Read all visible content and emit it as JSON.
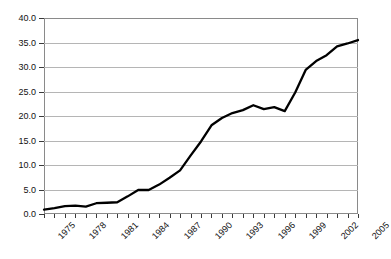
{
  "chart_data": {
    "type": "line",
    "title": "",
    "subtitle": "",
    "xlabel": "",
    "ylabel": "",
    "xlim": [
      1975,
      2005
    ],
    "ylim": [
      0.0,
      40.0
    ],
    "ytick_step": 5.0,
    "grid": "horizontal",
    "legend": "none",
    "line_color": "#000000",
    "gridline_color": "#b5b5b5",
    "axis_color": "#8a8a8a",
    "background": "#ffffff",
    "xtick_label_rotation": -45,
    "xtick_label_interval": 3,
    "ytick_labels": [
      "40.0",
      "35.0",
      "30.0",
      "25.0",
      "20.0",
      "15.0",
      "10.0",
      "5.0",
      "0.0"
    ],
    "ytick_values": [
      40.0,
      35.0,
      30.0,
      25.0,
      20.0,
      15.0,
      10.0,
      5.0,
      0.0
    ],
    "xtick_labels": [
      "1975",
      "1978",
      "1981",
      "1984",
      "1987",
      "1990",
      "1993",
      "1996",
      "1999",
      "2002",
      "2005"
    ],
    "xtick_values": [
      1975,
      1978,
      1981,
      1984,
      1987,
      1990,
      1993,
      1996,
      1999,
      2002,
      2005
    ],
    "x": [
      1975,
      1976,
      1977,
      1978,
      1979,
      1980,
      1981,
      1982,
      1983,
      1984,
      1985,
      1986,
      1987,
      1988,
      1989,
      1990,
      1991,
      1992,
      1993,
      1994,
      1995,
      1996,
      1997,
      1998,
      1999,
      2000,
      2001,
      2002,
      2003,
      2004,
      2005
    ],
    "values": [
      0.9,
      1.2,
      1.6,
      1.7,
      1.5,
      2.2,
      2.3,
      2.4,
      3.6,
      4.9,
      4.9,
      6.0,
      7.4,
      8.9,
      11.9,
      14.8,
      18.1,
      19.6,
      20.6,
      21.2,
      22.2,
      21.4,
      21.8,
      21.0,
      24.8,
      29.4,
      31.2,
      32.4,
      34.2,
      34.8,
      35.5
    ]
  }
}
